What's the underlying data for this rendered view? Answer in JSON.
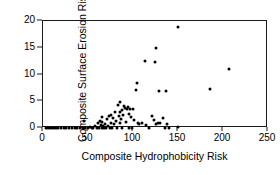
{
  "chart_data": {
    "type": "scatter",
    "title": "",
    "xlabel": "Composite Hydrophobicity Risk",
    "ylabel": "Composite Surface Erosion Risk",
    "xlim": [
      0,
      250
    ],
    "ylim": [
      0,
      20
    ],
    "xticks": [
      0,
      50,
      100,
      150,
      200,
      250
    ],
    "yticks": [
      0,
      5,
      10,
      15,
      20
    ],
    "grid": false,
    "legend": null,
    "marker": {
      "shape": "circle",
      "color": "#000000",
      "size_px": 3
    },
    "frame": "box",
    "points": [
      [
        3,
        0.05
      ],
      [
        6,
        0.05
      ],
      [
        8,
        0.05
      ],
      [
        10,
        0.05
      ],
      [
        12,
        0.05
      ],
      [
        14,
        0.05
      ],
      [
        17,
        0.05
      ],
      [
        20,
        0.05
      ],
      [
        23,
        0.05
      ],
      [
        26,
        0.05
      ],
      [
        29,
        0.05
      ],
      [
        32,
        0.05
      ],
      [
        35,
        0.05
      ],
      [
        38,
        0.05
      ],
      [
        41,
        0.05
      ],
      [
        44,
        0.05
      ],
      [
        45,
        1.4
      ],
      [
        47,
        0.05
      ],
      [
        50,
        0.05
      ],
      [
        52,
        0.2
      ],
      [
        54,
        0.05
      ],
      [
        56,
        0.05
      ],
      [
        58,
        0.3
      ],
      [
        60,
        0.05
      ],
      [
        61,
        0.9
      ],
      [
        62,
        0.05
      ],
      [
        63,
        1.3
      ],
      [
        64,
        0.6
      ],
      [
        65,
        0.05
      ],
      [
        66,
        1.1
      ],
      [
        66,
        2.0
      ],
      [
        67,
        0.3
      ],
      [
        68,
        0.05
      ],
      [
        69,
        0.8
      ],
      [
        70,
        0.05
      ],
      [
        71,
        1.6
      ],
      [
        72,
        0.4
      ],
      [
        73,
        2.3
      ],
      [
        74,
        0.05
      ],
      [
        75,
        1.0
      ],
      [
        76,
        2.5
      ],
      [
        77,
        0.05
      ],
      [
        78,
        1.9
      ],
      [
        79,
        0.7
      ],
      [
        80,
        2.9
      ],
      [
        81,
        1.3
      ],
      [
        82,
        0.05
      ],
      [
        83,
        4.3
      ],
      [
        84,
        2.2
      ],
      [
        85,
        0.9
      ],
      [
        85,
        4.9
      ],
      [
        86,
        3.0
      ],
      [
        87,
        1.6
      ],
      [
        88,
        3.4
      ],
      [
        88,
        0.05
      ],
      [
        89,
        2.4
      ],
      [
        90,
        4.2
      ],
      [
        91,
        3.8
      ],
      [
        92,
        1.2
      ],
      [
        93,
        3.5
      ],
      [
        94,
        4.0
      ],
      [
        95,
        2.7
      ],
      [
        96,
        0.05
      ],
      [
        97,
        3.6
      ],
      [
        98,
        2.1
      ],
      [
        99,
        0.05
      ],
      [
        100,
        3.5
      ],
      [
        101,
        1.5
      ],
      [
        103,
        7.1
      ],
      [
        104,
        8.5
      ],
      [
        105,
        0.9
      ],
      [
        107,
        0.8
      ],
      [
        110,
        1.0
      ],
      [
        113,
        12.5
      ],
      [
        114,
        0.6
      ],
      [
        118,
        0.05
      ],
      [
        121,
        2.2
      ],
      [
        123,
        1.5
      ],
      [
        124,
        12.3
      ],
      [
        125,
        14.9
      ],
      [
        126,
        0.7
      ],
      [
        128,
        0.9
      ],
      [
        129,
        6.9
      ],
      [
        130,
        1.0
      ],
      [
        133,
        1.8
      ],
      [
        135,
        0.05
      ],
      [
        137,
        6.9
      ],
      [
        138,
        0.7
      ],
      [
        140,
        0.05
      ],
      [
        150,
        18.9
      ],
      [
        150,
        0.1
      ],
      [
        186,
        7.2
      ],
      [
        207,
        11.0
      ]
    ]
  },
  "axes": {
    "x": {
      "label": "Composite Hydrophobicity Risk",
      "tick_labels": [
        "0",
        "50",
        "100",
        "150",
        "200",
        "250"
      ]
    },
    "y": {
      "label": "Composite Surface Erosion Risk",
      "tick_labels": [
        "0",
        "5",
        "10",
        "15",
        "20"
      ]
    }
  },
  "colors": {
    "marker": "#000000",
    "axis": "#1a1a1a",
    "background": "#ffffff"
  }
}
